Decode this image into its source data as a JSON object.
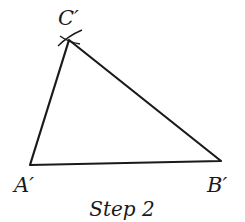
{
  "diagram": {
    "title": "Step 2",
    "vertices": {
      "A": {
        "label": "A′",
        "x": 30,
        "y": 165
      },
      "B": {
        "label": "B′",
        "x": 221,
        "y": 161
      },
      "C": {
        "label": "C′",
        "x": 69,
        "y": 40
      }
    },
    "stroke_color": "#1a1a1a",
    "arc_marks": "intersecting compass arcs at C′"
  }
}
